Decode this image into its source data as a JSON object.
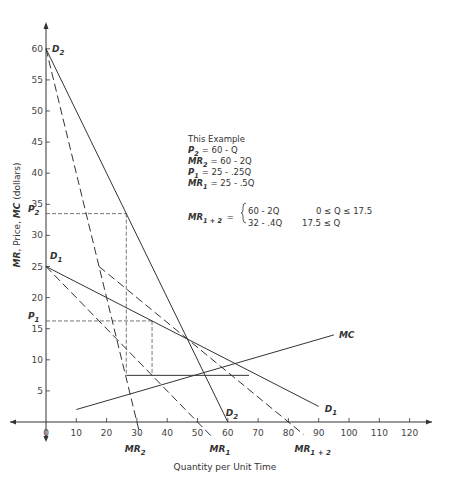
{
  "chart_data": {
    "type": "line",
    "title": "",
    "xlabel": "Quantity per Unit Time",
    "ylabel_parts": [
      "MR",
      ", Price, ",
      "MC",
      " (dollars)"
    ],
    "xlim": [
      0,
      125
    ],
    "ylim": [
      0,
      63
    ],
    "x_ticks": [
      0,
      10,
      20,
      30,
      40,
      50,
      60,
      70,
      80,
      90,
      100,
      110,
      120
    ],
    "y_ticks": [
      5,
      10,
      15,
      20,
      25,
      30,
      35,
      40,
      45,
      50,
      55,
      60
    ],
    "grid": false,
    "series": [
      {
        "name": "D2",
        "label": "D",
        "sub": "2",
        "style": "solid",
        "points": [
          [
            0,
            60
          ],
          [
            60,
            0
          ]
        ]
      },
      {
        "name": "MR2",
        "label": "MR",
        "sub": "2",
        "style": "dashed",
        "points": [
          [
            0,
            60
          ],
          [
            31,
            -2
          ]
        ]
      },
      {
        "name": "D1",
        "label": "D",
        "sub": "1",
        "style": "solid",
        "points": [
          [
            0,
            25
          ],
          [
            90,
            2.5
          ]
        ]
      },
      {
        "name": "MR1",
        "label": "MR",
        "sub": "1",
        "style": "dashed",
        "points": [
          [
            0,
            25
          ],
          [
            55,
            -2.5
          ]
        ]
      },
      {
        "name": "MR1+2",
        "label": "MR",
        "sub": "1 + 2",
        "style": "dashed",
        "points": [
          [
            17.5,
            25
          ],
          [
            85,
            -2
          ]
        ]
      },
      {
        "name": "MC",
        "label": "MC",
        "sub": "",
        "style": "solid",
        "points": [
          [
            10,
            2
          ],
          [
            95,
            14
          ]
        ]
      }
    ],
    "guides": {
      "p2": {
        "label": "P",
        "sub": "2",
        "price": 33.5,
        "quantity": 26.5
      },
      "p1": {
        "label": "P",
        "sub": "1",
        "price": 16.25,
        "quantity": 35
      },
      "mc_level": {
        "value": 7.5,
        "from_q": 26.5,
        "to_q": 67
      }
    },
    "annotation": {
      "heading": "This Example",
      "lines": [
        {
          "lhs": "P",
          "sub": "2",
          "rhs": "= 60 - Q"
        },
        {
          "lhs": "MR",
          "sub": "2",
          "rhs": "= 60 - 2Q"
        },
        {
          "lhs": "P",
          "sub": "1",
          "rhs": "= 25 - .25Q"
        },
        {
          "lhs": "MR",
          "sub": "1",
          "rhs": "= 25 - .5Q"
        }
      ],
      "piecewise": {
        "lhs": "MR",
        "sub": "1 + 2",
        "cases": [
          {
            "expr": "60 - 2Q",
            "cond": "0 ≤ Q  ≤ 17.5"
          },
          {
            "expr": "32 - .4Q",
            "cond": "17.5 ≤ Q"
          }
        ]
      }
    }
  }
}
